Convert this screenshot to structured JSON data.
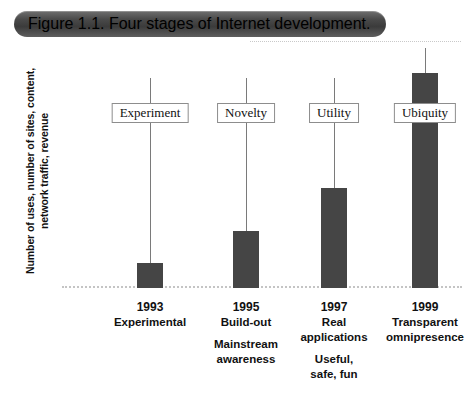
{
  "figure": {
    "banner_label": "Figure 1.1.  Four stages of Internet development."
  },
  "axes": {
    "y_label_line1": "Number of uses, number of sites, content,",
    "y_label_line2": "network traffic, revenue"
  },
  "colors": {
    "bar": "#454545",
    "banner": "#4a4a4a",
    "stem": "#7a7a7a",
    "baseline": "#c4c4c4"
  },
  "chart_data": {
    "type": "bar",
    "title": "Figure 1.1.  Four stages of Internet development.",
    "xlabel": "",
    "ylabel": "Number of uses, number of sites, content, network traffic, revenue",
    "categories": [
      "1993",
      "1995",
      "1997",
      "1999"
    ],
    "stage_names": [
      "Experiment",
      "Novelty",
      "Utility",
      "Ubiquity"
    ],
    "values": [
      25,
      57,
      100,
      215
    ],
    "ylim": [
      0,
      240
    ],
    "grid": false,
    "legend": "none",
    "annotations": [
      "Experimental",
      "Build-out / Mainstream awareness",
      "Real applications / Useful, safe, fun",
      "Transparent omnipresence"
    ]
  },
  "stages": [
    {
      "name": "Experiment",
      "year": "1993",
      "bar_height": 25,
      "stem_height": 210,
      "label_bottom": 165,
      "center": 88,
      "caption_lines": [
        "Experimental"
      ],
      "caption_gap_after": 0,
      "caption_lines2": []
    },
    {
      "name": "Novelty",
      "year": "1995",
      "bar_height": 57,
      "stem_height": 210,
      "label_bottom": 165,
      "center": 184,
      "caption_lines": [
        "Build-out"
      ],
      "caption_gap_after": 1,
      "caption_lines2": [
        "Mainstream",
        "awareness"
      ]
    },
    {
      "name": "Utility",
      "year": "1997",
      "bar_height": 100,
      "stem_height": 210,
      "label_bottom": 165,
      "center": 272,
      "caption_lines": [
        "Real",
        "applications"
      ],
      "caption_gap_after": 1,
      "caption_lines2": [
        "Useful,",
        "safe, fun"
      ]
    },
    {
      "name": "Ubiquity",
      "year": "1999",
      "bar_height": 215,
      "stem_height": 240,
      "label_bottom": 165,
      "center": 363,
      "caption_lines": [
        "Transparent",
        "omnipresence"
      ],
      "caption_gap_after": 0,
      "caption_lines2": []
    }
  ]
}
